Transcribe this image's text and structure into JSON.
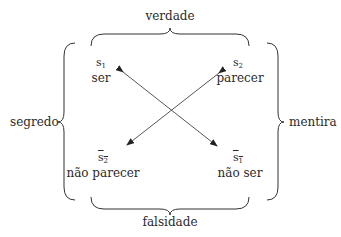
{
  "diagram": {
    "type": "semiotic-square",
    "braces": {
      "top": "verdade",
      "bottom": "falsidade",
      "left": "segredo",
      "right": "mentira"
    },
    "nodes": [
      {
        "id": "s1",
        "symbol": "s",
        "sub": "1",
        "negated": false,
        "label": "ser"
      },
      {
        "id": "s2",
        "symbol": "s",
        "sub": "2",
        "negated": false,
        "label": "parecer"
      },
      {
        "id": "not-s2",
        "symbol": "s",
        "sub": "2",
        "negated": true,
        "label": "não parecer"
      },
      {
        "id": "not-s1",
        "symbol": "s",
        "sub": "1",
        "negated": true,
        "label": "não ser"
      }
    ],
    "edges": [
      {
        "from": "s1",
        "to": "not-s1",
        "style": "double-arrow"
      },
      {
        "from": "s2",
        "to": "not-s2",
        "style": "double-arrow"
      }
    ]
  }
}
